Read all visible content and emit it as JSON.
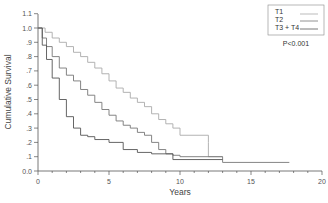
{
  "chart_data": {
    "type": "line",
    "subtype": "kaplan-meier",
    "title": "",
    "xlabel": "Years",
    "ylabel": "Cumulative Survival",
    "xlim": [
      0,
      20
    ],
    "ylim": [
      0.0,
      1.1
    ],
    "x_ticks": [
      "0",
      "5",
      "10",
      "15",
      "20"
    ],
    "y_ticks": [
      "0.0",
      ".1",
      ".2",
      ".3",
      ".4",
      ".5",
      ".6",
      ".7",
      ".8",
      ".9",
      "1.0",
      "1.1"
    ],
    "grid": false,
    "legend_position": "top-right",
    "annotation": "P<0.001",
    "series": [
      {
        "name": "T1",
        "color": "#aaaaaa",
        "x": [
          0,
          0.5,
          1,
          1.5,
          2,
          2.5,
          3,
          3.5,
          4,
          4.5,
          5,
          5.5,
          6,
          6.5,
          7,
          7.5,
          8,
          8.5,
          9,
          9.5,
          10,
          12,
          12,
          13
        ],
        "y": [
          1.0,
          0.97,
          0.93,
          0.9,
          0.87,
          0.83,
          0.8,
          0.76,
          0.72,
          0.68,
          0.63,
          0.58,
          0.55,
          0.51,
          0.48,
          0.45,
          0.4,
          0.36,
          0.33,
          0.3,
          0.25,
          0.2,
          0.1,
          0.1
        ]
      },
      {
        "name": "T2",
        "color": "#777777",
        "x": [
          0,
          0.3,
          0.6,
          1,
          1.5,
          2,
          2.5,
          3,
          3.5,
          4,
          4.5,
          5,
          5.5,
          6,
          6.5,
          7,
          7.5,
          8,
          8.5,
          9,
          9.5,
          10,
          13,
          13,
          17.7
        ],
        "y": [
          1.0,
          0.93,
          0.87,
          0.8,
          0.72,
          0.67,
          0.63,
          0.57,
          0.53,
          0.48,
          0.43,
          0.39,
          0.35,
          0.32,
          0.3,
          0.27,
          0.25,
          0.2,
          0.15,
          0.12,
          0.11,
          0.1,
          0.1,
          0.06,
          0.06
        ]
      },
      {
        "name": "T3 + T4",
        "color": "#555555",
        "x": [
          0,
          0.3,
          0.6,
          1,
          1.5,
          2,
          2.5,
          3,
          3.5,
          4,
          5,
          6,
          7,
          8,
          9,
          9.5,
          13
        ],
        "y": [
          1.0,
          0.88,
          0.78,
          0.65,
          0.5,
          0.38,
          0.3,
          0.25,
          0.24,
          0.22,
          0.2,
          0.15,
          0.13,
          0.12,
          0.12,
          0.08,
          0.08
        ]
      }
    ]
  },
  "legend": {
    "items": [
      {
        "label": "T1",
        "color": "#aaaaaa"
      },
      {
        "label": "T2",
        "color": "#777777"
      },
      {
        "label": "T3 + T4",
        "color": "#555555"
      }
    ],
    "pvalue": "P<0.001"
  }
}
